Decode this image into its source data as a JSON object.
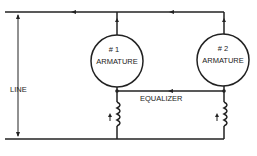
{
  "labels": {
    "armature1_num": "# 1",
    "armature1": "ARMATURE",
    "armature2_num": "# 2",
    "armature2": "ARMATURE",
    "line": "LINE",
    "equalizer": "EQUALIZER"
  },
  "colors": {
    "stroke": "#222222",
    "background": "#ffffff"
  }
}
